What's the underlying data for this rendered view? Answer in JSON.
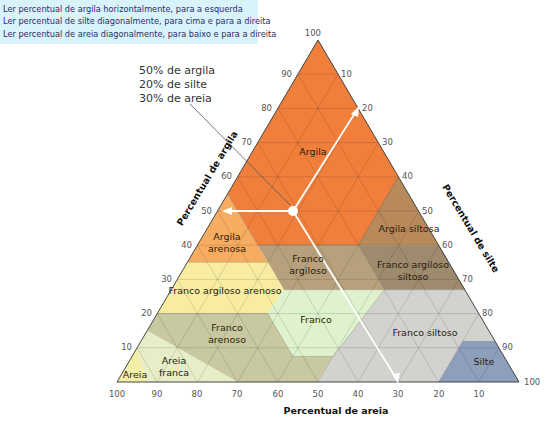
{
  "instructions": [
    "Ler percentual de argila horizontalmente, para a esquerda",
    "Ler percentual de silte diagonalmente, para cima e para a direita",
    "Ler percentual de areia diagonalmente, para baixo e para a direita"
  ],
  "example": {
    "lines": [
      "50% de argila",
      "20% de silte",
      "30% de areia"
    ],
    "clay": 50,
    "silt": 20,
    "sand": 30
  },
  "axes": {
    "clay": {
      "title": "Percentual de argila",
      "ticks": [
        "10",
        "20",
        "30",
        "40",
        "50",
        "60",
        "70",
        "80",
        "90",
        "100"
      ]
    },
    "silt": {
      "title": "Percentual de silte",
      "ticks": [
        "10",
        "20",
        "30",
        "40",
        "50",
        "60",
        "70",
        "80",
        "90",
        "100"
      ]
    },
    "sand": {
      "title": "Percentual de areia",
      "ticks": [
        "100",
        "90",
        "80",
        "70",
        "60",
        "50",
        "40",
        "30",
        "20",
        "10"
      ]
    }
  },
  "regions": [
    {
      "name": "Argila",
      "label": [
        "Argila"
      ],
      "color": "#f07f3c"
    },
    {
      "name": "Argila arenosa",
      "label": [
        "Argila",
        "arenosa"
      ],
      "color": "#f6ad62"
    },
    {
      "name": "Argila siltosa",
      "label": [
        "Argila siltosa"
      ],
      "color": "#b8895a"
    },
    {
      "name": "Franco argiloso",
      "label": [
        "Franco",
        "argiloso"
      ],
      "color": "#b7a17d"
    },
    {
      "name": "Franco argiloso siltoso",
      "label": [
        "Franco argiloso",
        "siltoso"
      ],
      "color": "#9e8a6c"
    },
    {
      "name": "Franco argiloso arenoso",
      "label": [
        "Franco argiloso arenoso"
      ],
      "color": "#f7ec9f"
    },
    {
      "name": "Franco",
      "label": [
        "Franco"
      ],
      "color": "#def3cd"
    },
    {
      "name": "Franco arenoso",
      "label": [
        "Franco",
        "arenoso"
      ],
      "color": "#c8c9a0"
    },
    {
      "name": "Franco siltoso",
      "label": [
        "Franco siltoso"
      ],
      "color": "#d2d3ce"
    },
    {
      "name": "Silte",
      "label": [
        "Silte"
      ],
      "color": "#8e9fbc"
    },
    {
      "name": "Areia franca",
      "label": [
        "Areia",
        "franca"
      ],
      "color": "#e7edc6"
    },
    {
      "name": "Areia",
      "label": [
        "Areia"
      ],
      "color": "#f3efa9"
    }
  ]
}
